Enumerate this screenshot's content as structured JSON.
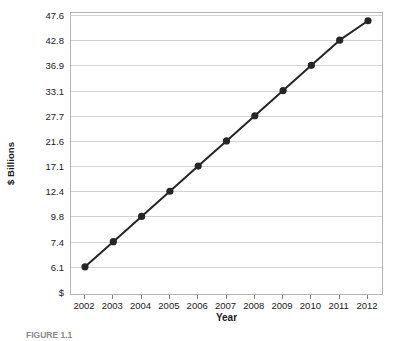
{
  "chart_data": {
    "type": "line",
    "title": "",
    "subtitle": "",
    "xlabel": "Year",
    "ylabel": "$ Billions",
    "categories": [
      "2002",
      "2003",
      "2004",
      "2005",
      "2006",
      "2007",
      "2008",
      "2009",
      "2010",
      "2011",
      "2012"
    ],
    "values": [
      6.1,
      7.4,
      9.8,
      12.4,
      17.1,
      21.6,
      27.7,
      33.1,
      36.9,
      42.8,
      46.5
    ],
    "y_tick_labels": [
      "$",
      "6.1",
      "7.4",
      "9.8",
      "12.4",
      "17.1",
      "21.6",
      "27.7",
      "33.1",
      "36.9",
      "42.8",
      "47.6"
    ],
    "y_tick_values": [
      0,
      6.1,
      7.4,
      9.8,
      12.4,
      17.1,
      21.6,
      27.7,
      33.1,
      36.9,
      42.8,
      47.6
    ],
    "y_axis_scale": "ordinal-ticks-evenly-spaced",
    "x_tick_labels": [
      "2002",
      "2003",
      "2004",
      "2005",
      "2006",
      "2007",
      "2008",
      "2009",
      "2010",
      "2011",
      "2012"
    ],
    "grid": "horizontal",
    "legend": "none",
    "legend_position": "none",
    "series": [
      {
        "name": "",
        "values": [
          6.1,
          7.4,
          9.8,
          12.4,
          17.1,
          21.6,
          27.7,
          33.1,
          36.9,
          42.8,
          46.5
        ],
        "marker": "filled-circle",
        "line_color": "#262626",
        "marker_color": "#262626"
      }
    ],
    "annotations": []
  },
  "style": {
    "line_color": "#262626",
    "marker_color": "#262626",
    "gridline_color": "#d2d2d2",
    "frame_color": "#b4b4b4",
    "text_color": "#1a1a1a",
    "background": "#ffffff"
  },
  "caption": {
    "label": "FIGURE 1.1",
    "text": ""
  }
}
